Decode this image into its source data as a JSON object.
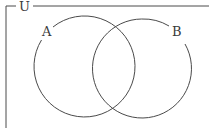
{
  "diagram": {
    "type": "venn",
    "universe_label": "U",
    "sets": [
      {
        "label": "A"
      },
      {
        "label": "B"
      }
    ],
    "colors": {
      "stroke": "#4a4a4a",
      "text": "#3a3a3a",
      "background": "#ffffff"
    }
  }
}
